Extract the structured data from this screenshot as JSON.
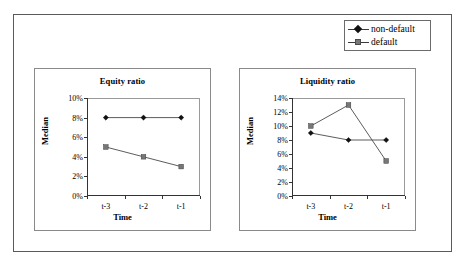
{
  "legend": {
    "entries": [
      {
        "label": "non-default",
        "marker": "diamond-marker-icon",
        "color": "#111111"
      },
      {
        "label": "default",
        "marker": "square-marker-icon",
        "color": "#777777"
      }
    ]
  },
  "chart_data": [
    {
      "type": "line",
      "title": "Equity ratio",
      "xlabel": "Time",
      "ylabel": "Median",
      "categories": [
        "t-3",
        "t-2",
        "t-1"
      ],
      "yticks": [
        "0%",
        "2%",
        "4%",
        "6%",
        "8%",
        "10%"
      ],
      "ytick_values": [
        0,
        2,
        4,
        6,
        8,
        10
      ],
      "ylim": [
        0,
        10
      ],
      "grid": false,
      "legend_position": "outside-top-right",
      "series": [
        {
          "name": "non-default",
          "values": [
            8,
            8,
            8
          ],
          "marker": "diamond",
          "color": "#111111"
        },
        {
          "name": "default",
          "values": [
            5,
            4,
            3
          ],
          "marker": "square",
          "color": "#777777"
        }
      ]
    },
    {
      "type": "line",
      "title": "Liquidity ratio",
      "xlabel": "Time",
      "ylabel": "Median",
      "categories": [
        "t-3",
        "t-2",
        "t-1"
      ],
      "yticks": [
        "0%",
        "2%",
        "4%",
        "6%",
        "8%",
        "10%",
        "12%",
        "14%"
      ],
      "ytick_values": [
        0,
        2,
        4,
        6,
        8,
        10,
        12,
        14
      ],
      "ylim": [
        0,
        14
      ],
      "grid": false,
      "legend_position": "outside-top-right",
      "series": [
        {
          "name": "non-default",
          "values": [
            9,
            8,
            8
          ],
          "marker": "diamond",
          "color": "#111111"
        },
        {
          "name": "default",
          "values": [
            10,
            13,
            5
          ],
          "marker": "square",
          "color": "#777777"
        }
      ]
    }
  ]
}
